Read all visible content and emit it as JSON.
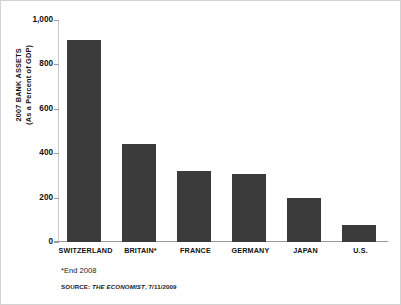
{
  "chart_data": {
    "type": "bar",
    "title": "",
    "xlabel": "",
    "ylabel": "2007 BANK ASSETS (As a Percent of GDP)",
    "ylabel_line1": "2007 BANK ASSETS",
    "ylabel_line2": "(As a Percent of GDP)",
    "categories": [
      "SWITZERLAND",
      "BRITAIN*",
      "FRANCE",
      "GERMANY",
      "JAPAN",
      "U.S."
    ],
    "values": [
      910,
      440,
      320,
      305,
      197,
      77
    ],
    "ylim": [
      0,
      1000
    ],
    "yticks": [
      0,
      200,
      400,
      600,
      800,
      1000
    ],
    "ytick_labels": [
      "0",
      "200",
      "400",
      "600",
      "800",
      "1,000"
    ],
    "grid": false,
    "legend": "none",
    "bar_color": "#3b3b3b",
    "background_color": "#ffffff",
    "axis_color": "#9a9a9a"
  },
  "footnote": "*End 2008",
  "source": {
    "prefix": "SOURCE: ",
    "publication": "THE ECONOMIST",
    "suffix": ", 7/11/2009"
  }
}
